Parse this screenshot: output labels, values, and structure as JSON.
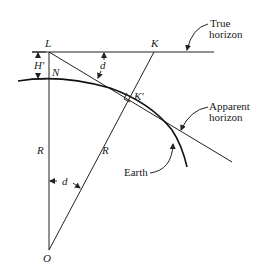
{
  "diagram": {
    "points": {
      "L": "L",
      "K": "K",
      "N": "N",
      "K_prime": "K'",
      "O": "O"
    },
    "dimensions": {
      "height": "H'",
      "angle_top": "d",
      "angle_center": "d",
      "radius_left": "R",
      "radius_right": "R"
    },
    "callouts": {
      "true_horizon_line1": "True",
      "true_horizon_line2": "horizon",
      "apparent_horizon_line1": "Apparent",
      "apparent_horizon_line2": "horizon",
      "earth": "Earth"
    }
  }
}
